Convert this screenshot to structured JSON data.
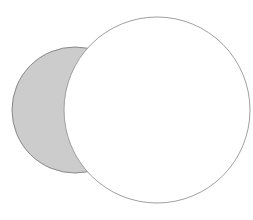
{
  "canvas": {
    "width": 253,
    "height": 220,
    "background": "#ffffff"
  },
  "shapes": [
    {
      "id": "gray-circle",
      "cx": 75,
      "cy": 110,
      "r": 63,
      "fill": "#cccccc",
      "stroke": "#888888",
      "stroke_width": 1
    },
    {
      "id": "white-circle",
      "cx": 157,
      "cy": 110,
      "r": 93,
      "fill": "#ffffff",
      "stroke": "#a0a0a0",
      "stroke_width": 1
    }
  ]
}
